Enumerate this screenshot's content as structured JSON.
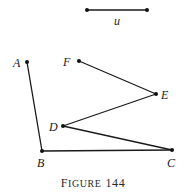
{
  "figure": {
    "caption_first": "F",
    "caption_rest": "IGURE",
    "caption_number": "144",
    "unit_segment": {
      "label": "u",
      "p1": [
        87,
        10
      ],
      "p2": [
        147,
        10
      ],
      "label_pos": [
        117,
        25
      ]
    },
    "points": {
      "A": {
        "label": "A",
        "pos": [
          27,
          62
        ],
        "label_pos": [
          13,
          67
        ]
      },
      "F": {
        "label": "F",
        "pos": [
          79,
          61
        ],
        "label_pos": [
          63,
          66
        ]
      },
      "E": {
        "label": "E",
        "pos": [
          156,
          94
        ],
        "label_pos": [
          161,
          99
        ]
      },
      "D": {
        "label": "D",
        "pos": [
          63,
          126
        ],
        "label_pos": [
          49,
          131
        ]
      },
      "B": {
        "label": "B",
        "pos": [
          42,
          151
        ],
        "label_pos": [
          37,
          167
        ]
      },
      "C": {
        "label": "C",
        "pos": [
          172,
          150
        ],
        "label_pos": [
          167,
          167
        ]
      }
    },
    "segments": [
      [
        "A",
        "B"
      ],
      [
        "B",
        "C"
      ],
      [
        "C",
        "D"
      ],
      [
        "D",
        "E"
      ],
      [
        "E",
        "F"
      ]
    ]
  }
}
